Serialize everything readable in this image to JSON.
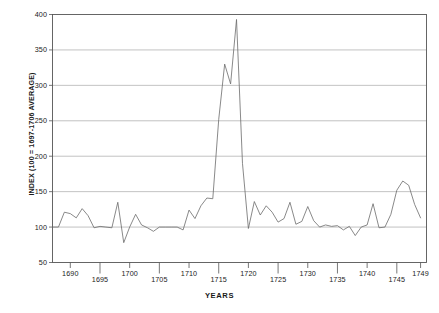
{
  "chart_data": {
    "type": "line",
    "title": "",
    "xlabel": "YEARS",
    "ylabel": "INDEX (100 = 1697-1706 AVERAGE)",
    "xlim": [
      1687,
      1750
    ],
    "ylim": [
      50,
      400
    ],
    "ytick_step": 50,
    "grid": "horizontal",
    "legend": "none",
    "ytick_labels": [
      "400",
      "350",
      "300",
      "250",
      "200",
      "150",
      "100",
      "50"
    ],
    "ytick_values": [
      400,
      350,
      300,
      250,
      200,
      150,
      100,
      50
    ],
    "xtick_labels": [
      "1690",
      "1695",
      "1700",
      "1705",
      "1710",
      "1715",
      "1720",
      "1725",
      "1730",
      "1735",
      "1740",
      "1745",
      "1749"
    ],
    "xtick_values": [
      1690,
      1695,
      1700,
      1705,
      1710,
      1715,
      1720,
      1725,
      1730,
      1735,
      1740,
      1745,
      1749
    ],
    "line_color": "#6b6b6b",
    "grid_color": "#999999",
    "axis_color": "#555555",
    "x": [
      1687,
      1688,
      1689,
      1690,
      1691,
      1692,
      1693,
      1694,
      1695,
      1696,
      1697,
      1698,
      1699,
      1700,
      1701,
      1702,
      1703,
      1704,
      1705,
      1706,
      1707,
      1708,
      1709,
      1710,
      1711,
      1712,
      1713,
      1714,
      1715,
      1716,
      1717,
      1718,
      1719,
      1720,
      1721,
      1722,
      1723,
      1724,
      1725,
      1726,
      1727,
      1728,
      1729,
      1730,
      1731,
      1732,
      1733,
      1734,
      1735,
      1736,
      1737,
      1738,
      1739,
      1740,
      1741,
      1742,
      1743,
      1744,
      1745,
      1746,
      1747,
      1748,
      1749
    ],
    "values": [
      100,
      100,
      121,
      119,
      113,
      126,
      116,
      99,
      101,
      100,
      99,
      135,
      78,
      100,
      118,
      103,
      99,
      94,
      100,
      100,
      100,
      100,
      96,
      124,
      112,
      130,
      141,
      140,
      252,
      330,
      302,
      393,
      190,
      98,
      136,
      117,
      130,
      121,
      107,
      112,
      135,
      104,
      108,
      129,
      109,
      100,
      103,
      101,
      102,
      96,
      101,
      88,
      100,
      103,
      133,
      99,
      100,
      118,
      152,
      165,
      159,
      132,
      113
    ]
  }
}
